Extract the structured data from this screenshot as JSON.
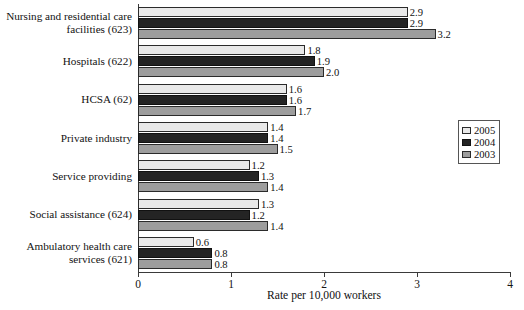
{
  "chart_data": {
    "type": "bar",
    "orientation": "horizontal",
    "title": "",
    "xlabel": "Rate per 10,000 workers",
    "ylabel": "",
    "xlim": [
      0,
      4
    ],
    "xticks": [
      "0",
      "1",
      "2",
      "3",
      "4"
    ],
    "grid": false,
    "legend_position": "right-middle",
    "categories": [
      "Nursing and residential care facilities (623)",
      "Hospitals (622)",
      "HCSA (62)",
      "Private industry",
      "Service providing",
      "Social assistance (624)",
      "Ambulatory health care services (621)"
    ],
    "category_lines": [
      [
        "Nursing and residential care",
        "facilities (623)"
      ],
      [
        "Hospitals (622)"
      ],
      [
        "HCSA (62)"
      ],
      [
        "Private industry"
      ],
      [
        "Service providing"
      ],
      [
        "Social assistance (624)"
      ],
      [
        "Ambulatory health care",
        "services (621)"
      ]
    ],
    "series": [
      {
        "name": "2005",
        "color": "#e9e9e9",
        "values": [
          2.9,
          1.8,
          1.6,
          1.4,
          1.2,
          1.3,
          0.6
        ]
      },
      {
        "name": "2004",
        "color": "#242424",
        "values": [
          2.9,
          1.9,
          1.6,
          1.4,
          1.3,
          1.2,
          0.8
        ]
      },
      {
        "name": "2003",
        "color": "#9d9d9d",
        "values": [
          3.2,
          2.0,
          1.7,
          1.5,
          1.4,
          1.4,
          0.8
        ]
      }
    ],
    "value_labels": [
      [
        "2.9",
        "2.9",
        "3.2"
      ],
      [
        "1.8",
        "1.9",
        "2.0"
      ],
      [
        "1.6",
        "1.6",
        "1.7"
      ],
      [
        "1.4",
        "1.4",
        "1.5"
      ],
      [
        "1.2",
        "1.3",
        "1.4"
      ],
      [
        "1.3",
        "1.2",
        "1.4"
      ],
      [
        "0.6",
        "0.8",
        "0.8"
      ]
    ]
  },
  "legend": {
    "entries": [
      {
        "label": "2005",
        "swatch": "y2005"
      },
      {
        "label": "2004",
        "swatch": "y2004"
      },
      {
        "label": "2003",
        "swatch": "y2003"
      }
    ]
  }
}
